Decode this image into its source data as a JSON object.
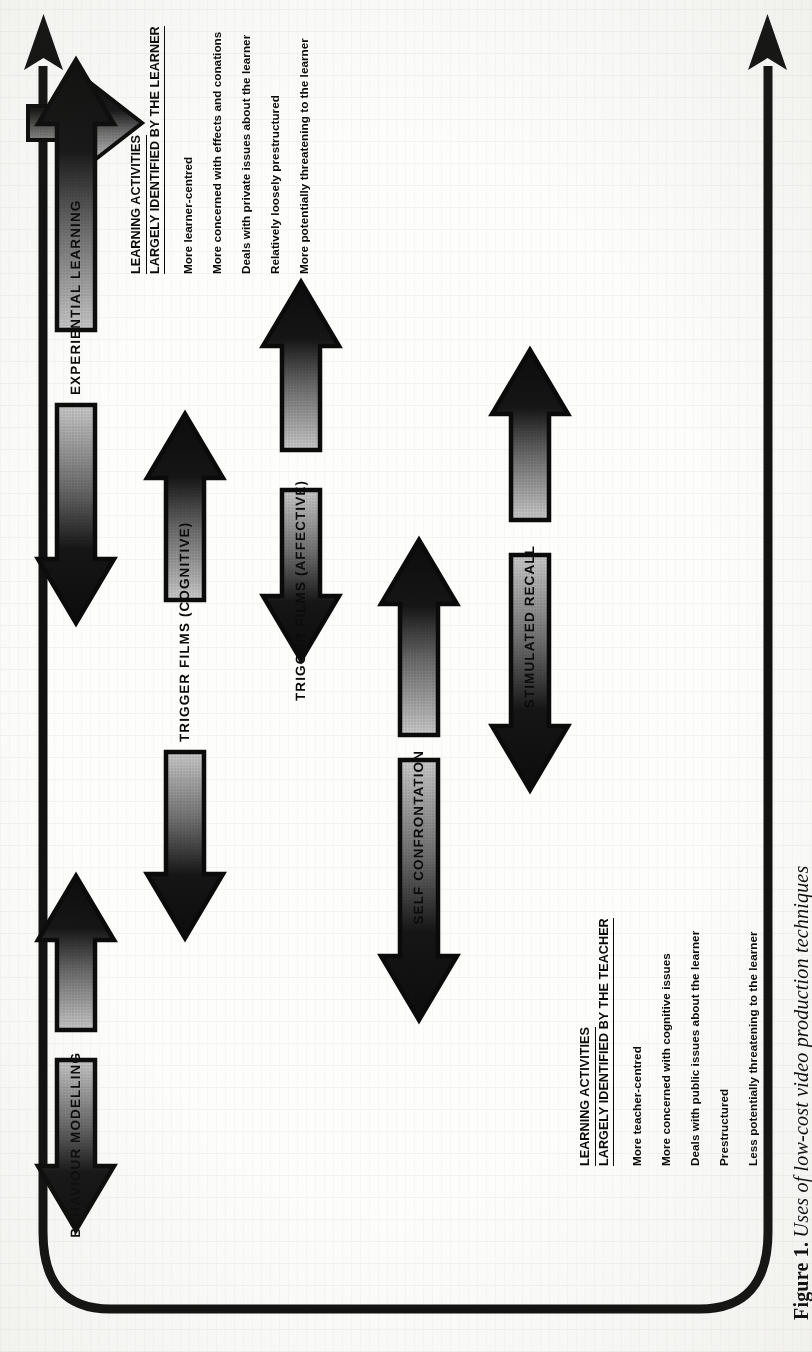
{
  "figure": {
    "caption_number": "Figure 1.",
    "caption_text": "Uses of low-cost video production techniques"
  },
  "axis": {
    "top_arrow_name": "learner-direction-axis",
    "bottom_arrow_name": "teacher-direction-axis"
  },
  "techniques": [
    {
      "label": "EXPERIENTIAL LEARNING"
    },
    {
      "label": "BEHAVIOUR MODELLING"
    },
    {
      "label": "TRIGGER FILMS (COGNITIVE)"
    },
    {
      "label": "TRIGGER FILMS (AFFECTIVE)"
    },
    {
      "label": "SELF CONFRONTATION"
    },
    {
      "label": "STIMULATED RECALL"
    }
  ],
  "learner_block": {
    "heading_line1": "LEARNING ACTIVITIES",
    "heading_line2": "LARGELY IDENTIFIED BY THE LEARNER",
    "items": [
      "More learner-centred",
      "More concerned with effects and conations",
      "Deals with private issues about the learner",
      "Relatively loosely prestructured",
      "More potentially threatening to the learner"
    ]
  },
  "teacher_block": {
    "heading_line1": "LEARNING ACTIVITIES",
    "heading_line2": "LARGELY IDENTIFIED BY THE TEACHER",
    "items": [
      "More teacher-centred",
      "More concerned with cognitive issues",
      "Deals with public issues about the learner",
      "Prestructured",
      "Less potentially threatening to the learner"
    ]
  },
  "colors": {
    "ink": "#0a0a0a",
    "paper": "#fdfdfb",
    "arrow_dark": "#111111",
    "arrow_light": "#d3d3d3"
  }
}
